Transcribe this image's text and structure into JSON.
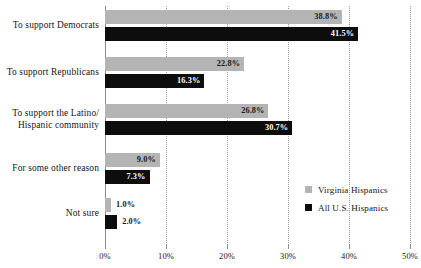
{
  "chart_data": {
    "type": "bar",
    "orientation": "horizontal",
    "title": "",
    "xlabel": "",
    "ylabel": "",
    "xlim": [
      0,
      50
    ],
    "xticks": [
      "0%",
      "10%",
      "20%",
      "30%",
      "40%",
      "50%"
    ],
    "xtick_values": [
      0,
      10,
      20,
      30,
      40,
      50
    ],
    "grid": true,
    "grid_style": "dotted-vertical",
    "legend_position": "bottom-right",
    "categories": [
      "To support Democrats",
      "To support Republicans",
      "To support the Latino/\nHispanic community",
      "For some other reason",
      "Not sure"
    ],
    "series": [
      {
        "name": "Virginia Hispanics",
        "color": "#b4b4b4",
        "values": [
          38.8,
          22.8,
          26.8,
          9.0,
          1.0
        ],
        "labels": [
          "38.8%",
          "22.8%",
          "26.8%",
          "9.0%",
          "1.0%"
        ]
      },
      {
        "name": "All U.S. Hispanics",
        "color": "#0d0d0d",
        "values": [
          41.5,
          16.3,
          30.7,
          7.3,
          2.0
        ],
        "labels": [
          "41.5%",
          "16.3%",
          "30.7%",
          "7.3%",
          "2.0%"
        ]
      }
    ]
  },
  "legend": {
    "items": [
      {
        "label": "Virginia Hispanics",
        "color": "#b4b4b4"
      },
      {
        "label": "All U.S. Hispanics",
        "color": "#0d0d0d"
      }
    ]
  }
}
